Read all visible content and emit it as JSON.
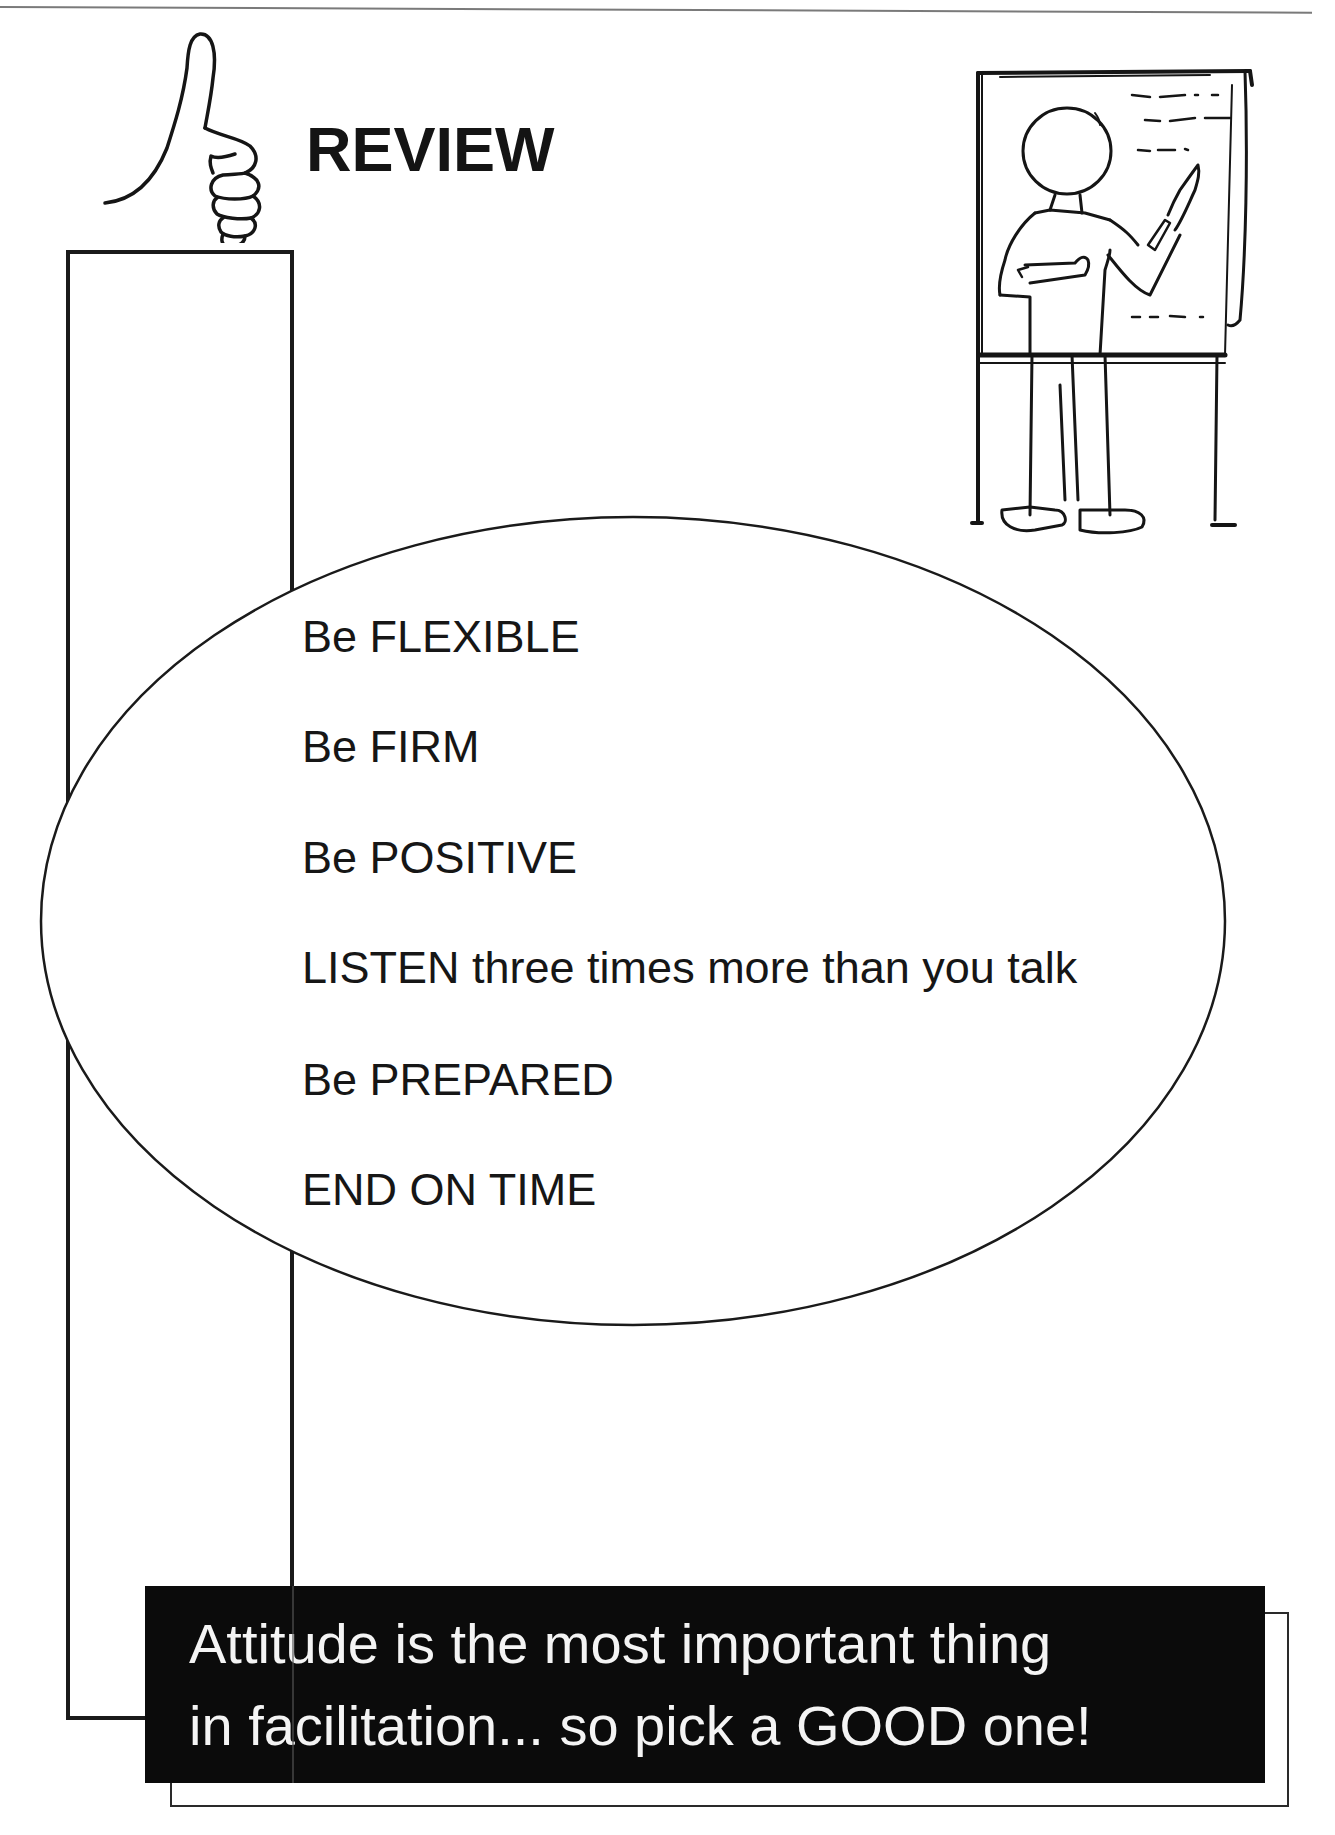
{
  "page": {
    "title": "REVIEW",
    "icons": {
      "title_icon": "thumbs-up-hand-drawing",
      "illustration": "presenter-at-flip-chart-easel-drawing"
    },
    "tips": [
      "Be FLEXIBLE",
      "Be FIRM",
      "Be POSITIVE",
      "LISTEN three times more than you talk",
      "Be PREPARED",
      "END ON TIME"
    ],
    "banner": {
      "lines": [
        "Attitude is the most important thing",
        "in facilitation... so pick a GOOD one!"
      ],
      "background_color": "#0b0b0b",
      "text_color": "#f4f4f4"
    }
  }
}
